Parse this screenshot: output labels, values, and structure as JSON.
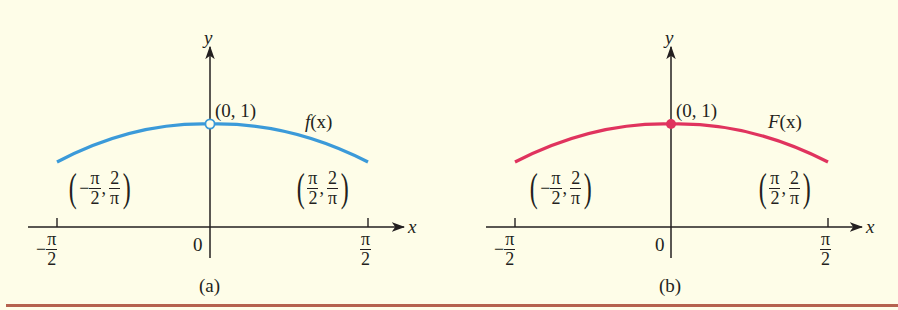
{
  "colors": {
    "background": "#fefde8",
    "axis": "#231f20",
    "curve_a": "#3b9ad9",
    "curve_b": "#e0335e",
    "bottom_rule": "#b5624f"
  },
  "panels": [
    {
      "id": "a",
      "caption": "(a)",
      "function_label": "f(x)",
      "function_name": "f",
      "arg": "(x)",
      "peak_label": "(0, 1)",
      "peak_marker": "open-circle",
      "x_axis_label": "x",
      "y_axis_label": "y",
      "origin_label": "0",
      "left_point": {
        "x_num": "−π",
        "x_den": "2",
        "y_num": "2",
        "y_den": "π",
        "sign": "−",
        "pi": "π",
        "two": "2"
      },
      "right_point": {
        "x_num": "π",
        "x_den": "2",
        "y_num": "2",
        "y_den": "π"
      },
      "left_tick": {
        "sign": "−",
        "num": "π",
        "den": "2"
      },
      "right_tick": {
        "num": "π",
        "den": "2"
      }
    },
    {
      "id": "b",
      "caption": "(b)",
      "function_label": "F(x)",
      "function_name": "F",
      "arg": "(x)",
      "peak_label": "(0, 1)",
      "peak_marker": "filled-dot",
      "x_axis_label": "x",
      "y_axis_label": "y",
      "origin_label": "0",
      "left_point": {
        "x_num": "π",
        "x_den": "2",
        "y_num": "2",
        "y_den": "π",
        "sign": "−"
      },
      "right_point": {
        "x_num": "π",
        "x_den": "2",
        "y_num": "2",
        "y_den": "π"
      },
      "left_tick": {
        "sign": "−",
        "num": "π",
        "den": "2"
      },
      "right_tick": {
        "num": "π",
        "den": "2"
      }
    }
  ],
  "punct": {
    "open": "(",
    "close": ")",
    "comma": ","
  }
}
